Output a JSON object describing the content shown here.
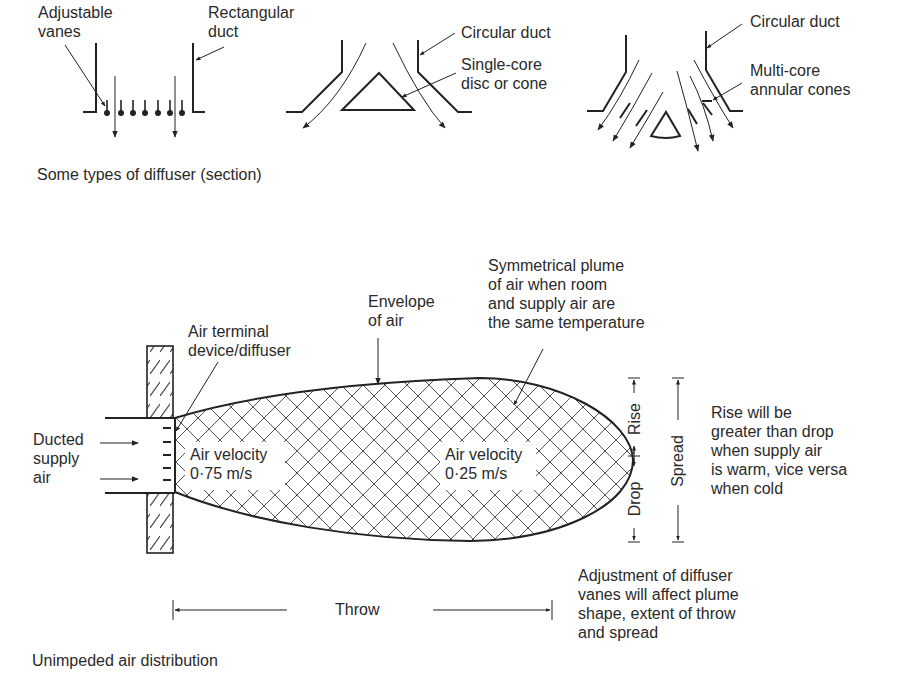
{
  "top_section": {
    "caption": "Some types of diffuser (section)",
    "diffuser_rectangular": {
      "label_vanes": "Adjustable\nvanes",
      "label_duct": "Rectangular\nduct"
    },
    "diffuser_single_core": {
      "label_duct": "Circular duct",
      "label_core": "Single-core\ndisc or cone"
    },
    "diffuser_multi_core": {
      "label_duct": "Circular duct",
      "label_core": "Multi-core\nannular cones"
    }
  },
  "bottom_section": {
    "caption": "Unimpeded air distribution",
    "labels": {
      "terminal": "Air terminal\ndevice/diffuser",
      "envelope": "Envelope\nof air",
      "symmetrical": "Symmetrical plume\nof air when room\nand supply air are\nthe same temperature",
      "ducted": "Ducted\nsupply\nair",
      "velocity_near": "Air velocity\n0·75 m/s",
      "velocity_far": "Air velocity\n0·25 m/s",
      "rise_note": "Rise will be\ngreater than drop\nwhen supply air\nis warm, vice versa\nwhen cold",
      "adjust_note": "Adjustment of diffuser\nvanes will affect plume\nshape, extent of throw\nand spread"
    },
    "dimensions": {
      "throw": "Throw",
      "rise": "Rise",
      "drop": "Drop",
      "spread": "Spread"
    }
  },
  "colors": {
    "ink": "#2a2a2a",
    "hatch": "#555555",
    "background": "#ffffff"
  }
}
